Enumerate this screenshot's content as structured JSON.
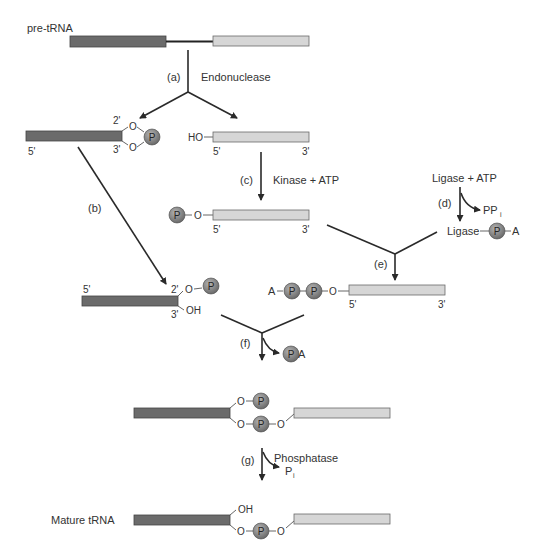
{
  "colors": {
    "exon5": "#6b6b6b",
    "exon3": "#d6d6d6",
    "phosphate": "#7a7a7a",
    "line": "#2a2a2a"
  },
  "labels": {
    "pre_trna": "pre-tRNA",
    "mature_trna": "Mature tRNA",
    "phosphate": "P",
    "oxygen": "O",
    "hydroxyl": "OH",
    "ho": "HO",
    "adenosine": "A",
    "five_prime": "5'",
    "three_prime": "3'",
    "two_prime": "2'",
    "ligase": "Ligase"
  },
  "steps": {
    "a": {
      "tag": "(a)",
      "enzyme": "Endonuclease"
    },
    "b": {
      "tag": "(b)"
    },
    "c": {
      "tag": "(c)",
      "enzyme": "Kinase + ATP"
    },
    "d": {
      "tag": "(d)",
      "enzyme": "Ligase + ATP",
      "byproduct": "PP",
      "byproduct_sub": "i"
    },
    "e": {
      "tag": "(e)"
    },
    "f": {
      "tag": "(f)",
      "byproduct": "A"
    },
    "g": {
      "tag": "(g)",
      "enzyme": "Phosphatase",
      "byproduct": "P",
      "byproduct_sub": "i"
    }
  }
}
